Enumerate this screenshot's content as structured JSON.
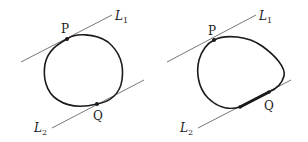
{
  "figures": [
    {
      "id": "left",
      "lines": [
        {
          "name": "L1",
          "label": "L",
          "subscript": "1"
        },
        {
          "name": "L2",
          "label": "L",
          "subscript": "2"
        }
      ],
      "points": [
        {
          "name": "P",
          "label": "P"
        },
        {
          "name": "Q",
          "label": "Q"
        }
      ],
      "description": "Closed convex curve tangent to parallel lines L1 at point P and L2 at point Q"
    },
    {
      "id": "right",
      "lines": [
        {
          "name": "L1",
          "label": "L",
          "subscript": "1"
        },
        {
          "name": "L2",
          "label": "L",
          "subscript": "2"
        }
      ],
      "points": [
        {
          "name": "P",
          "label": "P"
        },
        {
          "name": "Q",
          "label": "Q"
        }
      ],
      "description": "Closed convex curve tangent to L1 at P, with a straight segment lying along L2 (highlighted in bold) ending at Q"
    }
  ],
  "colors": {
    "curve": "#1a1a1a",
    "line": "#555555",
    "background": "#ffffff"
  }
}
